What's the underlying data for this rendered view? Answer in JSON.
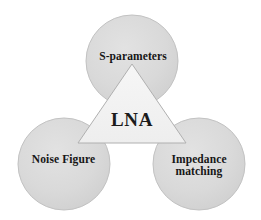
{
  "diagram": {
    "type": "venn-style concept diagram",
    "background_color": "#ffffff",
    "center": {
      "shape": "triangle",
      "label": "LNA",
      "fill_color": "#f2f2f2",
      "stroke_color": "#b4b4b4"
    },
    "nodes": [
      {
        "id": "s-parameters",
        "label": "S-parameters",
        "shape": "circle",
        "position": "top",
        "fill_color": "#d9d9d9",
        "stroke_color": "#c2c2c2",
        "cx": 132,
        "cy": 61,
        "r": 46
      },
      {
        "id": "noise-figure",
        "label": "Noise Figure",
        "shape": "circle",
        "position": "bottom-left",
        "fill_color": "#d9d9d9",
        "stroke_color": "#c2c2c2",
        "cx": 64,
        "cy": 164,
        "r": 46
      },
      {
        "id": "impedance-matching",
        "label": "Impedance\nmatching",
        "shape": "circle",
        "position": "bottom-right",
        "fill_color": "#d9d9d9",
        "stroke_color": "#c2c2c2",
        "cx": 199,
        "cy": 164,
        "r": 46
      }
    ]
  }
}
